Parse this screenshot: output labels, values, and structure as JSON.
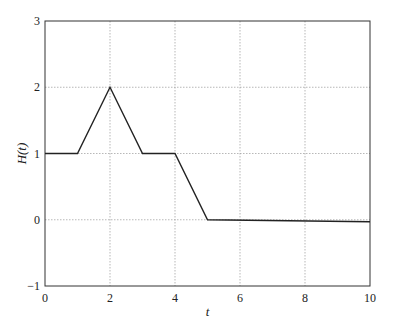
{
  "chart_data": {
    "type": "line",
    "title": "",
    "xlabel": "t",
    "ylabel": "H(t)",
    "xlim": [
      0,
      10
    ],
    "ylim": [
      -1,
      3
    ],
    "xticks": [
      0,
      2,
      4,
      6,
      8,
      10
    ],
    "yticks": [
      -1,
      0,
      1,
      2,
      3
    ],
    "grid": true,
    "legend": null,
    "series": [
      {
        "name": "H(t)",
        "x": [
          0,
          1,
          2,
          3,
          4,
          5,
          10
        ],
        "y": [
          1,
          1,
          2,
          1,
          1,
          0,
          -0.03
        ],
        "color": "#222222"
      }
    ]
  },
  "layout": {
    "plot_left": 45,
    "plot_right": 370,
    "plot_top": 21,
    "plot_bottom": 286
  }
}
